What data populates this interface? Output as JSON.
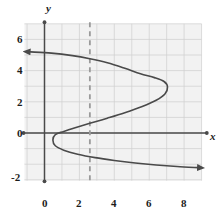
{
  "chart_data": {
    "type": "line",
    "title": "",
    "xlabel": "x",
    "ylabel": "y",
    "xlim": [
      -1.2,
      9.3
    ],
    "ylim": [
      -3.1,
      7.1
    ],
    "grid": true,
    "legend": null,
    "x_ticks": [
      0,
      2,
      4,
      6,
      8
    ],
    "x_tick_labels": [
      "0",
      "2",
      "4",
      "6",
      "8"
    ],
    "y_ticks": [
      -2,
      0,
      2,
      4,
      6
    ],
    "y_tick_labels": [
      "-2",
      "0",
      "2",
      "4",
      "6"
    ],
    "grid_step": 1,
    "series": [
      {
        "name": "sideways-s-curve",
        "style": "solid",
        "color": "#4a4a4a",
        "arrow_start": true,
        "arrow_end": true,
        "points": [
          [
            -0.8,
            5.2
          ],
          [
            0.4,
            5.12
          ],
          [
            1.6,
            4.96
          ],
          [
            2.6,
            4.76
          ],
          [
            3.6,
            4.5
          ],
          [
            4.6,
            4.15
          ],
          [
            5.5,
            3.8
          ],
          [
            6.3,
            3.55
          ],
          [
            6.85,
            3.3
          ],
          [
            7.05,
            2.95
          ],
          [
            6.9,
            2.5
          ],
          [
            6.4,
            2.1
          ],
          [
            5.6,
            1.7
          ],
          [
            4.6,
            1.3
          ],
          [
            3.6,
            0.95
          ],
          [
            2.6,
            0.62
          ],
          [
            1.8,
            0.35
          ],
          [
            1.1,
            0.1
          ],
          [
            0.62,
            -0.1
          ],
          [
            0.48,
            -0.45
          ],
          [
            0.62,
            -0.82
          ],
          [
            1.1,
            -1.1
          ],
          [
            1.9,
            -1.36
          ],
          [
            2.9,
            -1.58
          ],
          [
            4.0,
            -1.76
          ],
          [
            5.2,
            -1.92
          ],
          [
            6.4,
            -2.05
          ],
          [
            7.6,
            -2.15
          ],
          [
            8.8,
            -2.22
          ]
        ]
      }
    ],
    "annotations": [
      {
        "name": "vertical-line-test-line",
        "type": "vline",
        "x": 2.6,
        "style": "dashed",
        "color": "#9a9a9a",
        "y_from": -3.1,
        "y_to": 7.1
      }
    ],
    "axes": {
      "x_axis": {
        "from": -1.2,
        "to": 9.3,
        "endpoint_dots": true,
        "label": "x"
      },
      "y_axis": {
        "from": -3.1,
        "to": 7.1,
        "endpoint_dots": true,
        "label": "y"
      }
    },
    "colors": {
      "background": "#ffffff",
      "plot_background": "#f2f2f2",
      "grid": "#cfcfcf",
      "axis": "#4a4a4a",
      "curve": "#4a4a4a",
      "dashed_line": "#9a9a9a",
      "text": "#1c1c1c"
    }
  },
  "labels": {
    "x_axis_name": "x",
    "y_axis_name": "y",
    "x_tick_0": "0",
    "x_tick_2": "2",
    "x_tick_4": "4",
    "x_tick_6": "6",
    "x_tick_8": "8",
    "y_tick_neg2": "-2",
    "y_tick_0": "0",
    "y_tick_2": "2",
    "y_tick_4": "4",
    "y_tick_6": "6"
  }
}
